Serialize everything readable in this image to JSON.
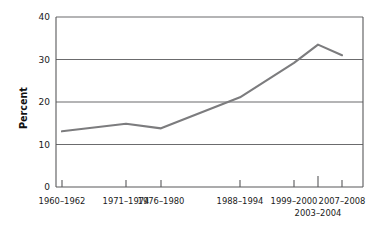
{
  "chart_data": {
    "type": "line",
    "title": "",
    "xlabel": "",
    "ylabel": "Percent",
    "ylim": [
      0,
      40
    ],
    "yticks": [
      0,
      10,
      20,
      30,
      40
    ],
    "ytick_labels": [
      "0",
      "10",
      "20",
      "30",
      "40"
    ],
    "grid": true,
    "grid_axis": "y",
    "legend": false,
    "categories": [
      "1960–1962",
      "1971–1974",
      "1976–1980",
      "1988–1994",
      "1999–2000",
      "2003–2004",
      "2007–2008"
    ],
    "values": [
      13.1,
      14.9,
      13.8,
      21.1,
      29.2,
      33.5,
      31.0
    ],
    "series": [
      {
        "name": "Percent",
        "values": [
          13.1,
          14.9,
          13.8,
          21.1,
          29.2,
          33.5,
          31.0
        ],
        "color": "#7c7c7e"
      }
    ],
    "x_positions": [
      62,
      126,
      161,
      240,
      294,
      318,
      342
    ],
    "xtick_row2_index": 5,
    "colors": {
      "line": "#7c7c7e",
      "axis": "#58585a",
      "grid": "#6b6b6d",
      "text": "#1a1a1a",
      "background": "#ffffff"
    }
  },
  "axis": {
    "y_title": "Percent"
  },
  "ticks": {
    "y": [
      {
        "label": "40",
        "value": 40
      },
      {
        "label": "30",
        "value": 30
      },
      {
        "label": "20",
        "value": 20
      },
      {
        "label": "10",
        "value": 10
      },
      {
        "label": "0",
        "value": 0
      }
    ],
    "x_row1": [
      {
        "label": "1960–1962",
        "x": 62
      },
      {
        "label": "1971–1974",
        "x": 126
      },
      {
        "label": "1976–1980",
        "x": 161
      },
      {
        "label": "1988–1994",
        "x": 240
      },
      {
        "label": "1999–2000",
        "x": 294
      },
      {
        "label": "2007–2008",
        "x": 342
      }
    ],
    "x_row2": [
      {
        "label": "2003–2004",
        "x": 318
      }
    ]
  }
}
